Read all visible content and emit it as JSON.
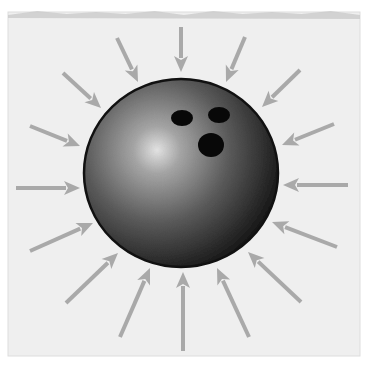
{
  "figure": {
    "description": "Bowling ball with gray arrows pointing inward from all directions",
    "canvas": {
      "width": 366,
      "height": 369,
      "background": "#ffffff"
    },
    "paper": {
      "x": 8,
      "y": 12,
      "width": 352,
      "height": 344,
      "fill": "#efefef",
      "top_edge_shade": "#c8c8c8",
      "border": "#dddddd"
    },
    "ball": {
      "cx": 181,
      "cy": 173,
      "rx": 97,
      "ry": 94,
      "outline": "#111111",
      "highlight": {
        "cx": 157,
        "cy": 150
      },
      "gradient_stops": [
        {
          "offset": "0%",
          "color": "#e4e4e4"
        },
        {
          "offset": "18%",
          "color": "#a6a6a6"
        },
        {
          "offset": "55%",
          "color": "#5c5c5c"
        },
        {
          "offset": "85%",
          "color": "#2c2c2c"
        },
        {
          "offset": "100%",
          "color": "#141414"
        }
      ],
      "finger_holes": [
        {
          "name": "finger-hole-left",
          "cx": 182,
          "cy": 118,
          "rx": 11,
          "ry": 8
        },
        {
          "name": "finger-hole-right",
          "cx": 219,
          "cy": 115,
          "rx": 11,
          "ry": 8
        },
        {
          "name": "thumb-hole",
          "cx": 211,
          "cy": 145,
          "rx": 13,
          "ry": 12
        }
      ],
      "hole_color": "#080808"
    },
    "arrows": {
      "color": "#a9a9a9",
      "stroke_width": 4,
      "head_length": 16,
      "head_half_width": 7,
      "items": [
        {
          "name": "arrow-top-left-outer",
          "x1": 63,
          "y1": 73,
          "x2": 101,
          "y2": 108
        },
        {
          "name": "arrow-top-left-inner",
          "x1": 117,
          "y1": 38,
          "x2": 138,
          "y2": 82
        },
        {
          "name": "arrow-top",
          "x1": 181,
          "y1": 27,
          "x2": 181,
          "y2": 72
        },
        {
          "name": "arrow-top-right-inner",
          "x1": 245,
          "y1": 37,
          "x2": 226,
          "y2": 82
        },
        {
          "name": "arrow-top-right-outer",
          "x1": 300,
          "y1": 70,
          "x2": 262,
          "y2": 107
        },
        {
          "name": "arrow-right-upper",
          "x1": 334,
          "y1": 124,
          "x2": 282,
          "y2": 145
        },
        {
          "name": "arrow-right",
          "x1": 348,
          "y1": 185,
          "x2": 283,
          "y2": 185
        },
        {
          "name": "arrow-right-lower",
          "x1": 337,
          "y1": 247,
          "x2": 272,
          "y2": 222
        },
        {
          "name": "arrow-bottom-right-outer",
          "x1": 301,
          "y1": 302,
          "x2": 248,
          "y2": 252
        },
        {
          "name": "arrow-bottom-right-inner",
          "x1": 249,
          "y1": 337,
          "x2": 217,
          "y2": 268
        },
        {
          "name": "arrow-bottom",
          "x1": 183,
          "y1": 351,
          "x2": 183,
          "y2": 272
        },
        {
          "name": "arrow-bottom-left-inner",
          "x1": 120,
          "y1": 337,
          "x2": 150,
          "y2": 268
        },
        {
          "name": "arrow-bottom-left-outer",
          "x1": 66,
          "y1": 303,
          "x2": 118,
          "y2": 253
        },
        {
          "name": "arrow-left-lower",
          "x1": 30,
          "y1": 251,
          "x2": 93,
          "y2": 223
        },
        {
          "name": "arrow-left",
          "x1": 16,
          "y1": 188,
          "x2": 80,
          "y2": 188
        },
        {
          "name": "arrow-left-upper",
          "x1": 30,
          "y1": 126,
          "x2": 80,
          "y2": 146
        }
      ]
    }
  }
}
